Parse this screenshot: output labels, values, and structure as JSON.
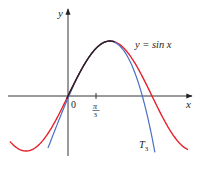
{
  "chart_data": {
    "type": "line",
    "title": "",
    "xlabel": "x",
    "ylabel": "y",
    "grid": false,
    "legend_position": "inline labels",
    "x_ticks": [
      {
        "value": 0,
        "label": "0"
      },
      {
        "value": 1.0472,
        "label": "π/3"
      }
    ],
    "xlim": [
      -2.3,
      4.6
    ],
    "ylim": [
      -1.1,
      1.6
    ],
    "series": [
      {
        "name": "y = sin x",
        "color": "#e8202a",
        "function": "sin(x)",
        "x_range": [
          -2.17,
          4.49
        ]
      },
      {
        "name": "T3",
        "color": "#4a6fc4",
        "function": "Taylor polynomial of degree 3 for sin x centered at π/3",
        "x_range": [
          -0.75,
          3.25
        ]
      }
    ],
    "annotations": [
      {
        "text": "y = sin x",
        "near": "peak of sine curve, right side"
      },
      {
        "text": "T3",
        "near": "lower end of blue curve"
      }
    ]
  },
  "labels": {
    "y_axis": "y",
    "x_axis": "x",
    "origin": "0",
    "tick_num": "π",
    "tick_den": "3",
    "sin_label": "y = sin x",
    "t3_main": "T",
    "t3_sub": "3"
  },
  "colors": {
    "sin": "#e8202a",
    "taylor": "#4a6fc4",
    "overlap": "#231f20",
    "axis": "#231f20"
  }
}
